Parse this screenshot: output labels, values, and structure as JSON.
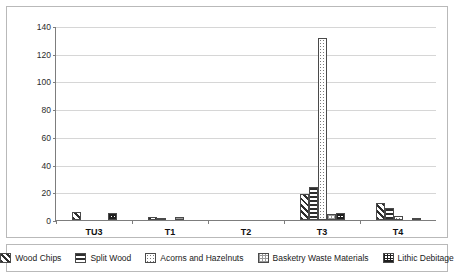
{
  "chart_data": {
    "type": "bar",
    "title": "",
    "subtitle": "",
    "xlabel": "",
    "ylabel": "",
    "ylim": [
      0,
      140
    ],
    "yticks": [
      0,
      20,
      40,
      60,
      80,
      100,
      120,
      140
    ],
    "ytick_labels": [
      "0",
      "20",
      "40",
      "60",
      "80",
      "100",
      "120",
      "140"
    ],
    "grid": true,
    "legend_position": "bottom",
    "categories": [
      "TU3",
      "T1",
      "T2",
      "T3",
      "T4"
    ],
    "series": [
      {
        "name": "Wood Chips",
        "pattern": "diagonal-hatch",
        "values": [
          6,
          2,
          0,
          19,
          12
        ]
      },
      {
        "name": "Split Wood",
        "pattern": "horizontal-lines",
        "values": [
          0,
          1,
          0,
          24,
          9
        ]
      },
      {
        "name": "Acorns and Hazelnuts",
        "pattern": "fine-dots",
        "values": [
          0,
          0,
          0,
          131,
          3
        ]
      },
      {
        "name": "Basketry Waste Materials",
        "pattern": "light-checker",
        "values": [
          0,
          2,
          0,
          4,
          0
        ]
      },
      {
        "name": "Lithic Debitage",
        "pattern": "dark-checker",
        "values": [
          5,
          0,
          0,
          5,
          1
        ]
      }
    ]
  },
  "legend": {
    "items": [
      {
        "label": "Wood Chips"
      },
      {
        "label": "Split Wood"
      },
      {
        "label": "Acorns and Hazelnuts"
      },
      {
        "label": "Basketry Waste Materials"
      },
      {
        "label": "Lithic Debitage"
      }
    ]
  },
  "colors": {
    "axis": "#7d7d7d",
    "grid": "#d6d6d6",
    "bar_border": "#4a4a4a",
    "frame": "#b9b9b9",
    "text": "#1a1a1a",
    "background": "#ffffff"
  }
}
